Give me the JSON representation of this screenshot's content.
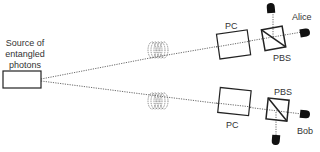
{
  "diagram": {
    "source": {
      "label_lines": [
        "Source of",
        "entangled",
        "photons"
      ]
    },
    "alice": {
      "name": "Alice",
      "pc_label": "PC",
      "pbs_label": "PBS"
    },
    "bob": {
      "name": "Bob",
      "pc_label": "PC",
      "pbs_label": "PBS"
    },
    "colors": {
      "stroke": "#222222",
      "fiber": "#555555",
      "detector": "#111111"
    }
  }
}
